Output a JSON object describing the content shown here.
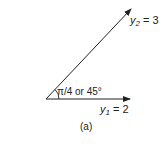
{
  "diagram": {
    "vectors": [
      {
        "name": "y1",
        "label_var": "y",
        "label_sub": "1",
        "label_rest": " = 2"
      },
      {
        "name": "y2",
        "label_var": "y",
        "label_sub": "2",
        "label_rest": " = 3"
      }
    ],
    "angle_label": "π/4 or 45°",
    "caption": "(a)",
    "colors": {
      "stroke": "#222222",
      "background": "#ffffff"
    }
  }
}
